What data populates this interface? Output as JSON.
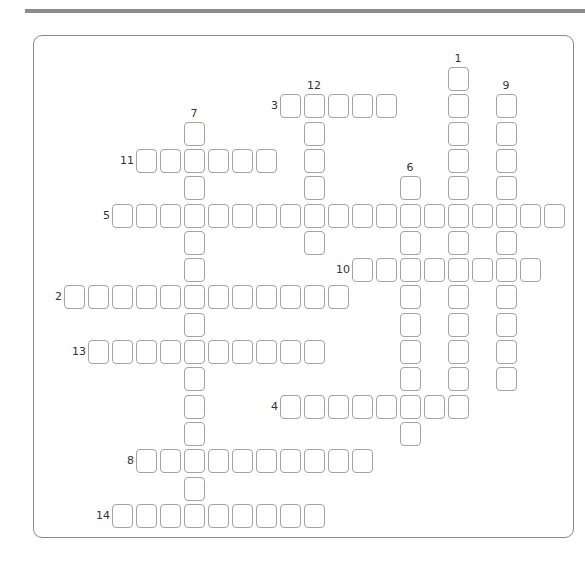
{
  "puzzle": {
    "layout": {
      "x0": 112,
      "y0": 67,
      "pitch_x": 24,
      "pitch_y": 27.3
    },
    "across": [
      {
        "number": "3",
        "row": 1,
        "col": 7,
        "length": 5
      },
      {
        "number": "11",
        "row": 3,
        "col": 1,
        "length": 6
      },
      {
        "number": "5",
        "row": 5,
        "col": 0,
        "length": 19
      },
      {
        "number": "10",
        "row": 7,
        "col": 10,
        "length": 8
      },
      {
        "number": "2",
        "row": 8,
        "col": -2,
        "length": 12
      },
      {
        "number": "13",
        "row": 10,
        "col": -1,
        "length": 10
      },
      {
        "number": "4",
        "row": 12,
        "col": 7,
        "length": 8
      },
      {
        "number": "8",
        "row": 14,
        "col": 1,
        "length": 10
      },
      {
        "number": "14",
        "row": 16,
        "col": 0,
        "length": 9
      }
    ],
    "down": [
      {
        "number": "1",
        "row": 0,
        "col": 14,
        "length": 13
      },
      {
        "number": "9",
        "row": 1,
        "col": 16,
        "length": 11
      },
      {
        "number": "12",
        "row": 1,
        "col": 8,
        "length": 6
      },
      {
        "number": "7",
        "row": 2,
        "col": 3,
        "length": 15
      },
      {
        "number": "6",
        "row": 4,
        "col": 12,
        "length": 10
      }
    ]
  }
}
